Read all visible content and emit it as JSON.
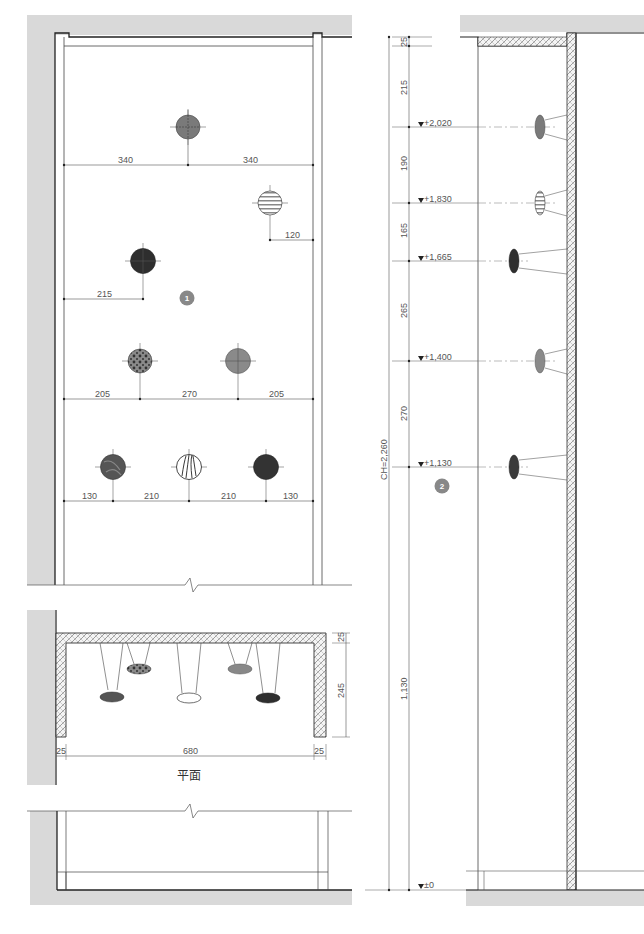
{
  "colors": {
    "wall_fill": "#d9d9d9",
    "line": "#333333",
    "thin_line": "#666666",
    "badge": "#888888",
    "light_gray_globe": "#8a8a8a",
    "dark_globe": "#3a3a3a"
  },
  "elevation_front": {
    "label_badge": "1",
    "dims": {
      "row1_left": "340",
      "row1_right": "340",
      "row2_right": "120",
      "row3_left": "215",
      "row4_left": "205",
      "row4_mid": "270",
      "row4_right": "205",
      "row5_a": "130",
      "row5_b": "210",
      "row5_c": "210",
      "row5_d": "130"
    }
  },
  "section_side": {
    "label_badge": "2",
    "total_height": "CH=2,260",
    "segments": [
      "25",
      "215",
      "190",
      "165",
      "265",
      "270",
      "1,130"
    ],
    "levels": [
      "+2,020",
      "+1,830",
      "+1,665",
      "+1,400",
      "+1,130",
      "±0"
    ]
  },
  "plan": {
    "title": "平面",
    "dims": {
      "left": "25",
      "width": "680",
      "right": "25",
      "top": "25",
      "depth": "245"
    }
  }
}
